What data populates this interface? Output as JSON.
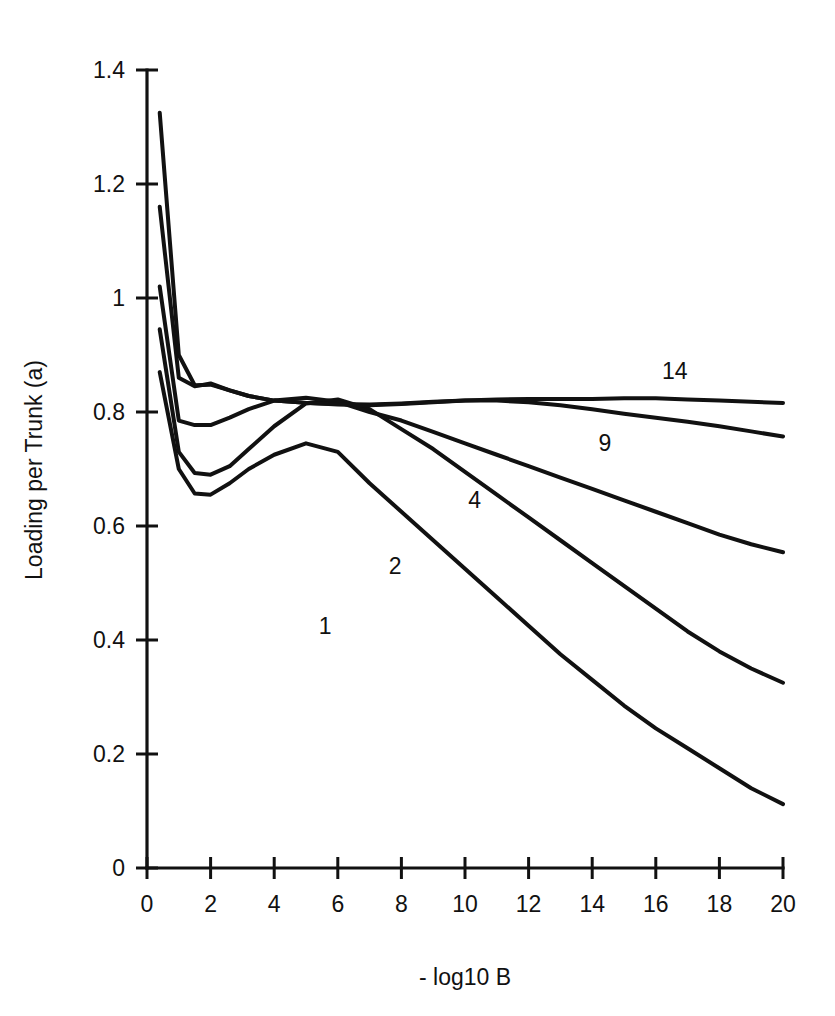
{
  "chart_data": {
    "type": "line",
    "title": "",
    "xlabel": "- log10 B",
    "ylabel": "Loading per Trunk (a)",
    "xlim": [
      0,
      20
    ],
    "ylim": [
      0,
      1.4
    ],
    "xticks": [
      "0",
      "2",
      "4",
      "6",
      "8",
      "10",
      "12",
      "14",
      "16",
      "18",
      "20"
    ],
    "xtick_values": [
      0,
      2,
      4,
      6,
      8,
      10,
      12,
      14,
      16,
      18,
      20
    ],
    "yticks": [
      "0",
      "0.2",
      "0.4",
      "0.6",
      "0.8",
      "1",
      "1.2",
      "1.4"
    ],
    "ytick_values": [
      0,
      0.2,
      0.4,
      0.6,
      0.8,
      1,
      1.2,
      1.4
    ],
    "grid": false,
    "legend": "inline-curve-labels",
    "series": [
      {
        "name": "1",
        "label": "1",
        "label_x": 5.6,
        "label_y": 0.425,
        "x": [
          0.4,
          1.0,
          1.5,
          2.0,
          2.6,
          3.2,
          4.0,
          5.0,
          6.0,
          7.0,
          8.0,
          9.0,
          10.0,
          11.0,
          12.0,
          13.0,
          14.0,
          15.0,
          16.0,
          17.0,
          18.0,
          19.0,
          20.0
        ],
        "y": [
          0.87,
          0.7,
          0.657,
          0.655,
          0.675,
          0.7,
          0.725,
          0.745,
          0.73,
          0.675,
          0.625,
          0.575,
          0.525,
          0.475,
          0.425,
          0.375,
          0.33,
          0.285,
          0.245,
          0.21,
          0.175,
          0.14,
          0.112
        ]
      },
      {
        "name": "2",
        "label": "2",
        "label_x": 7.8,
        "label_y": 0.53,
        "x": [
          0.4,
          1.0,
          1.5,
          2.0,
          2.6,
          3.2,
          4.0,
          5.0,
          6.0,
          7.0,
          8.0,
          9.0,
          10.0,
          11.0,
          12.0,
          13.0,
          14.0,
          15.0,
          16.0,
          17.0,
          18.0,
          19.0,
          20.0
        ],
        "y": [
          0.945,
          0.73,
          0.693,
          0.69,
          0.705,
          0.735,
          0.775,
          0.815,
          0.822,
          0.805,
          0.77,
          0.735,
          0.695,
          0.655,
          0.615,
          0.575,
          0.535,
          0.495,
          0.455,
          0.415,
          0.38,
          0.35,
          0.325
        ]
      },
      {
        "name": "4",
        "label": "4",
        "label_x": 10.3,
        "label_y": 0.645,
        "x": [
          0.4,
          1.0,
          1.5,
          2.0,
          2.6,
          3.2,
          4.0,
          5.0,
          6.0,
          7.0,
          8.0,
          9.0,
          10.0,
          11.0,
          12.0,
          13.0,
          14.0,
          15.0,
          16.0,
          17.0,
          18.0,
          19.0,
          20.0
        ],
        "y": [
          1.02,
          0.785,
          0.777,
          0.777,
          0.79,
          0.805,
          0.82,
          0.825,
          0.818,
          0.8,
          0.785,
          0.765,
          0.745,
          0.725,
          0.705,
          0.685,
          0.665,
          0.645,
          0.625,
          0.605,
          0.585,
          0.568,
          0.554
        ]
      },
      {
        "name": "9",
        "label": "9",
        "label_x": 14.4,
        "label_y": 0.745,
        "x": [
          0.4,
          1.0,
          1.5,
          2.0,
          2.6,
          3.2,
          4.0,
          5.0,
          6.0,
          7.0,
          8.0,
          9.0,
          10.0,
          11.0,
          12.0,
          13.0,
          14.0,
          15.0,
          16.0,
          17.0,
          18.0,
          19.0,
          20.0
        ],
        "y": [
          1.16,
          0.86,
          0.845,
          0.85,
          0.838,
          0.828,
          0.82,
          0.816,
          0.814,
          0.813,
          0.815,
          0.818,
          0.82,
          0.82,
          0.817,
          0.812,
          0.805,
          0.797,
          0.79,
          0.783,
          0.775,
          0.766,
          0.757
        ]
      },
      {
        "name": "14",
        "label": "14",
        "label_x": 16.6,
        "label_y": 0.872,
        "x": [
          0.4,
          1.0,
          1.5,
          2.0,
          2.6,
          3.2,
          4.0,
          5.0,
          6.0,
          7.0,
          8.0,
          9.0,
          10.0,
          11.0,
          12.0,
          13.0,
          14.0,
          15.0,
          16.0,
          17.0,
          18.0,
          19.0,
          20.0
        ],
        "y": [
          1.325,
          0.9,
          0.847,
          0.848,
          0.838,
          0.828,
          0.82,
          0.816,
          0.813,
          0.812,
          0.814,
          0.817,
          0.82,
          0.822,
          0.823,
          0.823,
          0.823,
          0.824,
          0.824,
          0.822,
          0.82,
          0.818,
          0.816
        ]
      }
    ]
  },
  "geometry": {
    "origin_x": 147,
    "origin_y": 868,
    "right_x": 783,
    "top_y": 70
  }
}
